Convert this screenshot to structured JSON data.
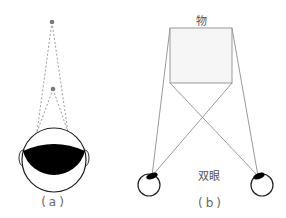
{
  "figure_a": {
    "caption": "(a)",
    "far_point": {
      "x": 52,
      "y": 22
    },
    "near_point": {
      "x": 53,
      "y": 89
    }
  },
  "figure_b": {
    "caption": "(b)",
    "object_label": "物",
    "eyes_label": "双眼"
  },
  "colors": {
    "line": "#999999",
    "dashed": "#9a9a9a",
    "fill_dark": "#000000",
    "outline": "#222222"
  }
}
